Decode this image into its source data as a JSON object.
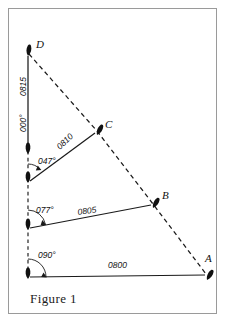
{
  "figure": {
    "caption": "Figure 1",
    "type": "bearing-survey-diagram",
    "frame": {
      "border_color": "#9a9a9a",
      "background": "#ffffff"
    },
    "line_color": "#111111"
  },
  "points": [
    {
      "id": "D",
      "label": "D",
      "x": 28,
      "y": 52,
      "label_x": 36,
      "label_y": 48
    },
    {
      "id": "C",
      "label": "C",
      "x": 97,
      "y": 131,
      "label_x": 105,
      "label_y": 128
    },
    {
      "id": "B",
      "label": "B",
      "x": 153,
      "y": 204,
      "label_x": 162,
      "label_y": 199
    },
    {
      "id": "A",
      "label": "A",
      "x": 207,
      "y": 277,
      "label_x": 207,
      "label_y": 262
    }
  ],
  "stations": [
    {
      "id": "S0",
      "x": 28,
      "y": 277
    },
    {
      "id": "S1",
      "x": 28,
      "y": 228
    },
    {
      "id": "S2",
      "x": 28,
      "y": 181
    },
    {
      "id": "S3",
      "x": 28,
      "y": 152
    }
  ],
  "bearings": [
    {
      "label": "090°",
      "value": 90,
      "from": "S0",
      "to": "A",
      "label_x": 38,
      "label_y": 258
    },
    {
      "label": "077°",
      "value": 77,
      "from": "S1",
      "to": "B",
      "label_x": 36,
      "label_y": 213
    },
    {
      "label": "047°",
      "value": 47,
      "from": "S2",
      "to": "C",
      "label_x": 38,
      "label_y": 164
    },
    {
      "label": "000°",
      "value": 0,
      "from": "S3",
      "to": "D",
      "label_x": 26,
      "label_y": 130,
      "rotated": true
    }
  ],
  "times": [
    {
      "label": "0800",
      "leg": "S0-A",
      "label_x": 118,
      "label_y": 268,
      "rotation": -0.5
    },
    {
      "label": "0805",
      "leg": "S1-B",
      "label_x": 88,
      "label_y": 213,
      "rotation": -7
    },
    {
      "label": "0810",
      "leg": "S2-C",
      "label_x": 68,
      "label_y": 142,
      "rotation": -44
    },
    {
      "label": "0815",
      "leg": "S3-D",
      "label_x": 26,
      "label_y": 88,
      "rotation": -90
    }
  ],
  "track": {
    "style": "dashed",
    "points": [
      "D",
      "C",
      "B",
      "A"
    ],
    "description": "dashed track line from D through C and B to A"
  }
}
